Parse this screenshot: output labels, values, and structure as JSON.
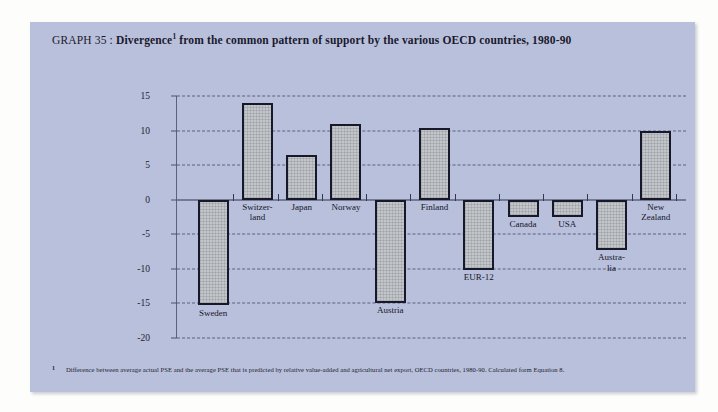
{
  "title": {
    "prefix": "GRAPH 35 : ",
    "bold_part": "Divergence",
    "footnote_marker": "1",
    "rest": " from the common pattern of support by the various OECD countries, 1980-90"
  },
  "footnote": {
    "marker": "1",
    "text": "Difference between average actual PSE and the average PSE that is predicted by relative value-added and agricultural net export, OECD countries, 1980-90. Calculated form Equation 8."
  },
  "colors": {
    "panel_background": "#b9c0dc",
    "bar_fill": "#c3c6c8",
    "bar_border": "#17182a",
    "gridline": "#3a3e63",
    "axis": "#5d6080",
    "text": "#1b1c2e"
  },
  "chart_data": {
    "type": "bar",
    "xlabel": "",
    "ylabel": "",
    "ylim": [
      -20,
      15
    ],
    "yticks": [
      15,
      10,
      5,
      0,
      -5,
      -10,
      -15,
      -20
    ],
    "ytick_labels": [
      "15",
      "10",
      "5",
      "0",
      "-5",
      "-10",
      "-15",
      "-20"
    ],
    "grid": true,
    "legend": "none",
    "categories": [
      "Sweden",
      "Switzer-\nland",
      "Japan",
      "Norway",
      "Austria",
      "Finland",
      "EUR-12",
      "Canada",
      "USA",
      "Austra-\nlia",
      "New\nZealand"
    ],
    "values": [
      -15.3,
      14.0,
      6.4,
      11.0,
      -15.0,
      10.3,
      -10.1,
      -2.5,
      -2.5,
      -7.3,
      10.0
    ]
  }
}
